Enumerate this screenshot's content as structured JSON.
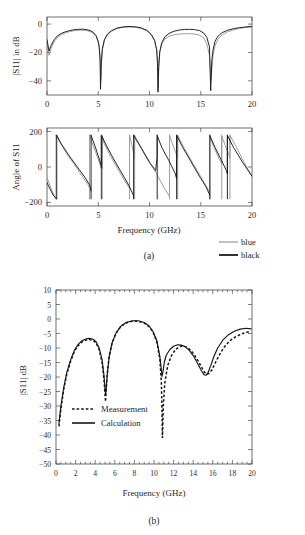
{
  "figure": {
    "panel_a_caption": "(a)",
    "panel_b_caption": "(b)"
  },
  "panel_a": {
    "legend": [
      {
        "label": "blue",
        "color": "#8d8d8d"
      },
      {
        "label": "black",
        "color": "#1b1b1b"
      }
    ],
    "xlabel": "Frequency (GHz)"
  },
  "panel_b": {
    "xlabel": "Frequency (GHz)",
    "legend": [
      {
        "label": "Measurement",
        "style": "dashed"
      },
      {
        "label": "Calculation",
        "style": "solid"
      }
    ]
  },
  "chart_data": [
    {
      "id": "s11-magnitude",
      "type": "line",
      "title": "",
      "xlabel": "",
      "ylabel": "|S11| in dB",
      "xlim": [
        0,
        20
      ],
      "ylim": [
        -50,
        5
      ],
      "xticks": [
        0,
        5,
        10,
        15,
        20
      ],
      "yticks": [
        0,
        -20,
        -40
      ],
      "ytick_labels": [
        "0",
        "−20",
        "−40"
      ],
      "grid": false,
      "legend_position": "below-right",
      "series": [
        {
          "name": "blue",
          "color": "#8d8d8d",
          "x": [
            0,
            0.2,
            0.4,
            0.7,
            1.0,
            1.4,
            1.8,
            2.2,
            2.6,
            3.0,
            3.4,
            3.8,
            4.2,
            4.5,
            4.8,
            5.0,
            5.1,
            5.2,
            5.25,
            5.3,
            5.4,
            5.6,
            5.9,
            6.3,
            6.8,
            7.4,
            8.0,
            8.6,
            9.2,
            9.8,
            10.2,
            10.5,
            10.7,
            10.8,
            10.85,
            10.9,
            11.0,
            11.2,
            11.5,
            11.9,
            12.4,
            12.9,
            13.4,
            13.9,
            14.4,
            14.9,
            15.3,
            15.6,
            15.85,
            16.0,
            16.1,
            16.2,
            16.4,
            16.7,
            17.1,
            17.6,
            18.2,
            18.8,
            19.4,
            20.0
          ],
          "y": [
            -14,
            -22,
            -17,
            -12.5,
            -9.5,
            -7.5,
            -6.2,
            -5.3,
            -4.7,
            -4.4,
            -4.3,
            -4.5,
            -5.2,
            -6.4,
            -9.0,
            -13.0,
            -17.0,
            -25.0,
            -40.0,
            -28.0,
            -18.0,
            -11.5,
            -7.5,
            -5.0,
            -3.2,
            -2.3,
            -2.0,
            -2.2,
            -3.0,
            -5.0,
            -8.0,
            -12.0,
            -18.0,
            -27.0,
            -45.0,
            -30.0,
            -20.0,
            -14.0,
            -10.5,
            -8.6,
            -7.5,
            -7.0,
            -6.8,
            -6.8,
            -7.0,
            -7.8,
            -10.0,
            -14.0,
            -22.0,
            -40.0,
            -30.0,
            -22.0,
            -15.0,
            -10.5,
            -7.5,
            -5.5,
            -4.0,
            -3.0,
            -2.4,
            -2.0
          ]
        },
        {
          "name": "black",
          "color": "#1b1b1b",
          "x": [
            0,
            0.2,
            0.4,
            0.7,
            1.0,
            1.4,
            1.8,
            2.2,
            2.6,
            3.0,
            3.4,
            3.8,
            4.2,
            4.5,
            4.8,
            5.0,
            5.1,
            5.18,
            5.22,
            5.3,
            5.4,
            5.6,
            5.9,
            6.3,
            6.8,
            7.4,
            8.0,
            8.6,
            9.2,
            9.8,
            10.2,
            10.5,
            10.7,
            10.78,
            10.83,
            10.9,
            11.0,
            11.2,
            11.5,
            11.9,
            12.4,
            12.9,
            13.4,
            13.9,
            14.4,
            14.9,
            15.3,
            15.6,
            15.85,
            15.97,
            16.08,
            16.2,
            16.4,
            16.7,
            17.1,
            17.6,
            18.2,
            18.8,
            19.4,
            20.0
          ],
          "y": [
            -11,
            -19,
            -15,
            -11.0,
            -8.4,
            -6.6,
            -5.4,
            -4.6,
            -4.0,
            -3.7,
            -3.6,
            -3.8,
            -4.5,
            -5.7,
            -8.2,
            -12.2,
            -16.5,
            -26.0,
            -46.0,
            -27.0,
            -17.5,
            -11.0,
            -7.0,
            -4.6,
            -2.9,
            -2.0,
            -1.7,
            -1.9,
            -2.7,
            -4.6,
            -7.5,
            -11.5,
            -18.0,
            -28.0,
            -48.0,
            -30.0,
            -19.5,
            -13.0,
            -9.0,
            -6.6,
            -5.0,
            -4.2,
            -3.8,
            -3.7,
            -3.9,
            -4.6,
            -6.4,
            -9.5,
            -16.0,
            -47.0,
            -26.0,
            -18.0,
            -12.0,
            -8.4,
            -6.0,
            -4.4,
            -3.2,
            -2.5,
            -2.0,
            -1.7
          ]
        }
      ]
    },
    {
      "id": "s11-phase",
      "type": "line",
      "title": "",
      "xlabel": "Frequency (GHz)",
      "ylabel": "Angle of S11",
      "xlim": [
        0,
        20
      ],
      "ylim": [
        -220,
        220
      ],
      "xticks": [
        0,
        5,
        10,
        15,
        20
      ],
      "yticks": [
        200,
        0,
        -200
      ],
      "ytick_labels": [
        "200",
        "0",
        "−200"
      ],
      "grid": false,
      "legend_position": "below-right",
      "series": [
        {
          "name": "blue",
          "color": "#8d8d8d",
          "wrap_points": [
            0.88,
            4.15,
            5.28,
            8.05,
            8.55,
            11.95,
            12.75,
            15.85,
            17.05,
            17.85
          ],
          "x": [
            0,
            0.3,
            0.6,
            0.87,
            0.88,
            1.3,
            1.9,
            2.6,
            3.3,
            4.0,
            4.14,
            4.15,
            4.5,
            4.9,
            5.2,
            5.27,
            5.28,
            5.6,
            6.2,
            6.9,
            7.5,
            8.0,
            8.04,
            8.05,
            8.3,
            8.5,
            8.54,
            8.55,
            9.2,
            10.0,
            10.8,
            11.5,
            11.9,
            11.94,
            11.95,
            12.3,
            12.7,
            12.74,
            12.75,
            13.4,
            14.2,
            15.0,
            15.6,
            15.84,
            15.85,
            16.3,
            16.8,
            17.04,
            17.05,
            17.4,
            17.8,
            17.84,
            17.85,
            18.4,
            19.2,
            20.0
          ],
          "y": [
            -60,
            -105,
            -150,
            -178,
            180,
            135,
            78,
            20,
            -40,
            -100,
            -118,
            180,
            120,
            60,
            10,
            -5,
            178,
            130,
            60,
            -10,
            -70,
            -115,
            -120,
            180,
            120,
            60,
            45,
            178,
            110,
            30,
            -50,
            -125,
            -160,
            -165,
            180,
            120,
            60,
            52,
            178,
            105,
            25,
            -55,
            -115,
            -140,
            175,
            110,
            45,
            20,
            175,
            120,
            60,
            50,
            178,
            120,
            30,
            -55
          ]
        },
        {
          "name": "black",
          "color": "#1b1b1b",
          "wrap_points": [
            0.95,
            4.3,
            5.35,
            8.45,
            10.75,
            12.65,
            15.9,
            17.6
          ],
          "x": [
            0,
            0.3,
            0.6,
            0.93,
            0.95,
            1.4,
            2.1,
            2.9,
            3.7,
            4.2,
            4.29,
            4.3,
            4.7,
            5.1,
            5.3,
            5.34,
            5.35,
            5.8,
            6.5,
            7.3,
            8.0,
            8.43,
            8.44,
            8.45,
            9.2,
            10.0,
            10.6,
            10.74,
            10.75,
            11.2,
            11.9,
            12.5,
            12.64,
            12.65,
            13.2,
            14.0,
            14.8,
            15.5,
            15.89,
            15.9,
            16.4,
            17.0,
            17.5,
            17.59,
            17.6,
            18.2,
            19.1,
            20.0
          ],
          "y": [
            -88,
            -125,
            -158,
            -180,
            178,
            130,
            68,
            5,
            -58,
            -105,
            -135,
            178,
            115,
            45,
            5,
            -8,
            175,
            120,
            45,
            -35,
            -105,
            -160,
            -170,
            178,
            105,
            25,
            -20,
            55,
            178,
            110,
            35,
            -35,
            -65,
            178,
            115,
            35,
            -45,
            -110,
            -160,
            175,
            110,
            40,
            -20,
            -38,
            178,
            110,
            25,
            -52
          ]
        }
      ]
    },
    {
      "id": "s11-measurement-calculation",
      "type": "line",
      "title": "",
      "xlabel": "Frequency (GHz)",
      "ylabel": "|S11| dB",
      "xlim": [
        0,
        20
      ],
      "ylim": [
        -50,
        10
      ],
      "xticks": [
        0,
        2,
        4,
        6,
        8,
        10,
        12,
        14,
        16,
        18,
        20
      ],
      "yticks": [
        10,
        5,
        0,
        -5,
        -10,
        -15,
        -20,
        -25,
        -30,
        -35,
        -40,
        -45,
        -50
      ],
      "ytick_labels": [
        "10",
        "5",
        "0",
        "−5",
        "−10",
        "−15",
        "−20",
        "−25",
        "−30",
        "−35",
        "−40",
        "−45",
        "−50"
      ],
      "grid": false,
      "legend_position": "inside-lower-left",
      "series": [
        {
          "name": "Measurement",
          "style": "dashed",
          "color": "#161616",
          "x": [
            0.3,
            0.5,
            0.8,
            1.1,
            1.5,
            1.9,
            2.3,
            2.7,
            3.1,
            3.4,
            3.8,
            4.1,
            4.4,
            4.7,
            4.9,
            5.0,
            5.05,
            5.1,
            5.2,
            5.4,
            5.7,
            6.1,
            6.6,
            7.2,
            7.8,
            8.4,
            9.0,
            9.5,
            9.9,
            10.3,
            10.6,
            10.75,
            10.82,
            10.86,
            10.95,
            11.1,
            11.4,
            11.8,
            12.2,
            12.6,
            13.0,
            13.4,
            13.8,
            14.2,
            14.6,
            15.0,
            15.3,
            15.6,
            15.9,
            16.2,
            16.6,
            17.1,
            17.7,
            18.3,
            18.9,
            19.4,
            19.8
          ],
          "y": [
            -37,
            -31,
            -24,
            -19,
            -14.5,
            -11.0,
            -9.0,
            -7.8,
            -7.2,
            -7.1,
            -7.4,
            -8.3,
            -10.5,
            -15.0,
            -21.0,
            -26.0,
            -28.5,
            -26.0,
            -20.0,
            -13.5,
            -8.5,
            -5.0,
            -2.6,
            -1.3,
            -0.8,
            -0.8,
            -1.4,
            -2.6,
            -4.5,
            -8.0,
            -14.0,
            -22.0,
            -32.0,
            -41.0,
            -30.0,
            -22.0,
            -16.0,
            -12.5,
            -10.5,
            -9.5,
            -9.3,
            -9.8,
            -11.0,
            -12.8,
            -15.0,
            -17.5,
            -19.0,
            -18.8,
            -17.6,
            -15.5,
            -12.8,
            -10.0,
            -7.6,
            -6.2,
            -5.2,
            -4.6,
            -4.4
          ]
        },
        {
          "name": "Calculation",
          "style": "solid",
          "color": "#161616",
          "x": [
            0.3,
            0.5,
            0.8,
            1.1,
            1.5,
            1.9,
            2.3,
            2.7,
            3.1,
            3.4,
            3.8,
            4.1,
            4.4,
            4.7,
            4.9,
            5.0,
            5.06,
            5.12,
            5.25,
            5.45,
            5.75,
            6.15,
            6.65,
            7.2,
            7.8,
            8.4,
            9.0,
            9.5,
            9.9,
            10.3,
            10.6,
            10.75,
            10.82,
            10.9,
            11.05,
            11.25,
            11.6,
            12.0,
            12.4,
            12.8,
            13.2,
            13.6,
            14.0,
            14.4,
            14.8,
            15.1,
            15.3,
            15.5,
            15.8,
            16.1,
            16.5,
            17.0,
            17.6,
            18.2,
            18.8,
            19.4,
            19.9
          ],
          "y": [
            -36,
            -30,
            -23.5,
            -18.5,
            -14.0,
            -10.6,
            -8.6,
            -7.4,
            -6.8,
            -6.7,
            -7.0,
            -7.9,
            -10.0,
            -14.0,
            -19.5,
            -24.0,
            -26.0,
            -24.0,
            -18.5,
            -12.5,
            -8.0,
            -4.7,
            -2.4,
            -1.1,
            -0.6,
            -0.6,
            -1.2,
            -2.4,
            -4.3,
            -7.6,
            -13.0,
            -17.5,
            -19.8,
            -18.5,
            -15.0,
            -12.5,
            -10.6,
            -9.4,
            -8.9,
            -9.0,
            -9.6,
            -10.8,
            -12.6,
            -15.0,
            -17.6,
            -19.2,
            -19.4,
            -18.6,
            -16.0,
            -13.0,
            -10.0,
            -7.4,
            -5.4,
            -4.2,
            -3.5,
            -3.2,
            -3.4
          ]
        }
      ]
    }
  ]
}
